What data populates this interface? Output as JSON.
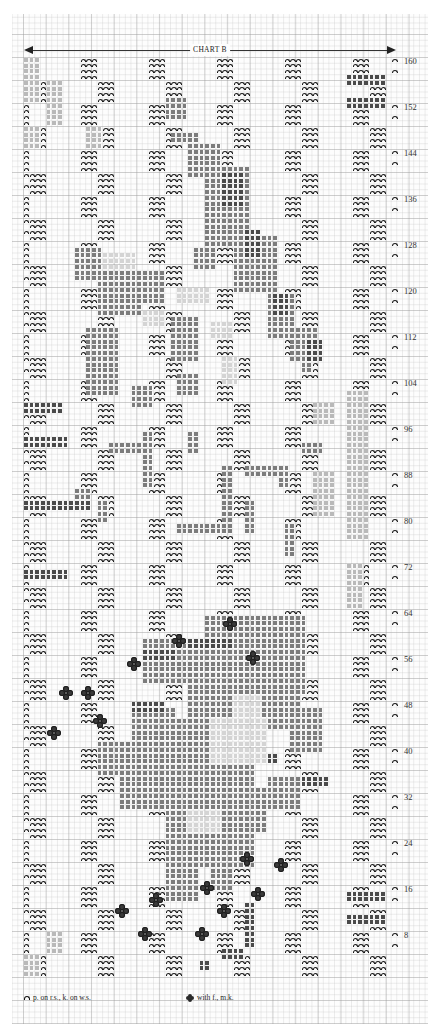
{
  "chart": {
    "title": "CHART B",
    "columns": 66,
    "rows": 160,
    "row_labels": [
      "160",
      "152",
      "144",
      "136",
      "128",
      "120",
      "112",
      "104",
      "96",
      "88",
      "80",
      "72",
      "64",
      "56",
      "48",
      "40",
      "32",
      "24",
      "16",
      "8"
    ],
    "row_label_values": [
      160,
      152,
      144,
      136,
      128,
      120,
      112,
      104,
      96,
      88,
      80,
      72,
      64,
      56,
      48,
      40,
      32,
      24,
      16,
      8
    ],
    "colors": {
      "dark_square": "#4a4a4a",
      "medium_square": "#7c7c7c",
      "light_square": "#b9b9b9",
      "pale_square": "#d4d4d4",
      "symbol": "#1a1a1a",
      "grid": "#c8c8c8"
    },
    "basket": {
      "block_width": 6,
      "block_height": 4,
      "purl_rows_per_block": 4
    },
    "motifs": [
      {
        "shade": 3,
        "rects": [
          [
            1,
            153,
            3,
            8
          ],
          [
            5,
            149,
            3,
            8
          ],
          [
            12,
            145,
            3,
            4
          ],
          [
            1,
            145,
            3,
            4
          ]
        ]
      },
      {
        "shade": 3,
        "rects": [
          [
            58,
            65,
            3,
            8
          ],
          [
            58,
            77,
            4,
            12
          ],
          [
            58,
            89,
            4,
            8
          ],
          [
            52,
            81,
            4,
            8
          ],
          [
            58,
            97,
            4,
            6
          ],
          [
            1,
            1,
            3,
            4
          ],
          [
            5,
            5,
            3,
            4
          ],
          [
            52,
            97,
            4,
            4
          ]
        ]
      },
      {
        "shade": 1,
        "rects": [
          [
            58,
            152,
            7,
            2
          ],
          [
            58,
            156,
            7,
            2
          ],
          [
            58,
            10,
            7,
            2
          ],
          [
            58,
            14,
            7,
            2
          ],
          [
            1,
            70,
            8,
            2
          ],
          [
            1,
            82,
            12,
            2
          ],
          [
            1,
            93,
            8,
            2
          ],
          [
            1,
            99,
            7,
            2
          ]
        ]
      },
      {
        "shade": 2,
        "rects": [
          [
            26,
            150,
            4,
            4
          ],
          [
            27,
            146,
            5,
            2
          ],
          [
            30,
            140,
            6,
            6
          ],
          [
            33,
            128,
            8,
            14
          ],
          [
            38,
            120,
            8,
            10
          ],
          [
            44,
            112,
            5,
            8
          ],
          [
            48,
            108,
            5,
            6
          ],
          [
            50,
            106,
            2,
            2
          ],
          [
            31,
            124,
            4,
            4
          ]
        ]
      },
      {
        "shade": 1,
        "rects": [
          [
            36,
            135,
            4,
            6
          ],
          [
            40,
            126,
            3,
            5
          ],
          [
            45,
            116,
            3,
            4
          ],
          [
            51,
            108,
            3,
            4
          ]
        ]
      },
      {
        "shade": 2,
        "rects": [
          [
            10,
            122,
            5,
            6
          ],
          [
            14,
            116,
            8,
            8
          ],
          [
            21,
            118,
            5,
            6
          ],
          [
            27,
            108,
            5,
            8
          ],
          [
            12,
            102,
            6,
            12
          ],
          [
            20,
            100,
            4,
            4
          ],
          [
            28,
            102,
            4,
            4
          ]
        ]
      },
      {
        "shade": 4,
        "rects": [
          [
            15,
            124,
            6,
            3
          ],
          [
            22,
            114,
            4,
            3
          ],
          [
            28,
            118,
            6,
            3
          ],
          [
            34,
            112,
            4,
            3
          ],
          [
            36,
            104,
            3,
            5
          ]
        ]
      },
      {
        "shade": 2,
        "rects": [
          [
            10,
            84,
            3,
            2
          ],
          [
            16,
            92,
            6,
            2
          ],
          [
            22,
            86,
            2,
            10
          ],
          [
            28,
            78,
            10,
            2
          ],
          [
            36,
            80,
            2,
            10
          ],
          [
            40,
            88,
            6,
            2
          ],
          [
            30,
            92,
            2,
            4
          ],
          [
            46,
            86,
            2,
            4
          ],
          [
            50,
            92,
            4,
            2
          ],
          [
            47,
            74,
            2,
            6
          ],
          [
            14,
            80,
            2,
            4
          ],
          [
            40,
            78,
            2,
            6
          ]
        ]
      },
      {
        "shade": 2,
        "rects": [
          [
            33,
            50,
            18,
            14
          ],
          [
            30,
            44,
            18,
            8
          ],
          [
            22,
            52,
            14,
            8
          ],
          [
            20,
            30,
            8,
            18
          ],
          [
            26,
            20,
            16,
            26
          ],
          [
            34,
            26,
            10,
            8
          ],
          [
            44,
            30,
            6,
            6
          ],
          [
            48,
            40,
            6,
            8
          ],
          [
            44,
            46,
            6,
            4
          ],
          [
            14,
            36,
            6,
            6
          ],
          [
            18,
            30,
            3,
            6
          ],
          [
            26,
            14,
            6,
            8
          ],
          [
            34,
            16,
            4,
            4
          ]
        ]
      },
      {
        "shade": 1,
        "rects": [
          [
            30,
            58,
            8,
            2
          ],
          [
            22,
            56,
            6,
            2
          ],
          [
            20,
            47,
            6,
            2
          ],
          [
            38,
            38,
            8,
            2
          ],
          [
            50,
            34,
            5,
            2
          ]
        ]
      },
      {
        "shade": 4,
        "rects": [
          [
            34,
            38,
            10,
            8
          ],
          [
            38,
            46,
            5,
            4
          ],
          [
            30,
            26,
            6,
            4
          ]
        ]
      },
      {
        "shade": 1,
        "rects": [
          [
            32,
            2,
            2,
            2
          ],
          [
            36,
            4,
            4,
            2
          ],
          [
            40,
            6,
            2,
            8
          ]
        ]
      }
    ],
    "bobbles": [
      {
        "col": 28,
        "row": 59
      },
      {
        "col": 41,
        "row": 56
      },
      {
        "col": 37,
        "row": 62
      },
      {
        "col": 20,
        "row": 55
      },
      {
        "col": 14,
        "row": 45
      },
      {
        "col": 12,
        "row": 50
      },
      {
        "col": 6,
        "row": 43
      },
      {
        "col": 8,
        "row": 50
      },
      {
        "col": 40,
        "row": 21
      },
      {
        "col": 46,
        "row": 20
      },
      {
        "col": 42,
        "row": 15
      },
      {
        "col": 33,
        "row": 16
      },
      {
        "col": 36,
        "row": 12
      },
      {
        "col": 24,
        "row": 14
      },
      {
        "col": 18,
        "row": 12
      },
      {
        "col": 22,
        "row": 8
      },
      {
        "col": 32,
        "row": 8
      }
    ]
  },
  "legend": {
    "purl_symbol": "purl-bump",
    "purl_text": "p. on  r.s., k. on w.s.",
    "bobble_symbol": "bobble-cluster",
    "bobble_text": "with f., m.k."
  }
}
